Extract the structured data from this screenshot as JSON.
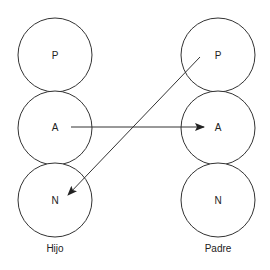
{
  "diagram": {
    "columns": [
      {
        "id": "hijo",
        "label": "Hijo",
        "nodes": [
          {
            "id": "hijo-p",
            "label": "P"
          },
          {
            "id": "hijo-a",
            "label": "A"
          },
          {
            "id": "hijo-n",
            "label": "N"
          }
        ]
      },
      {
        "id": "padre",
        "label": "Padre",
        "nodes": [
          {
            "id": "padre-p",
            "label": "P"
          },
          {
            "id": "padre-a",
            "label": "A"
          },
          {
            "id": "padre-n",
            "label": "N"
          }
        ]
      }
    ],
    "edges": [
      {
        "from": "hijo-a",
        "to": "padre-a"
      },
      {
        "from": "padre-p",
        "to": "hijo-n"
      }
    ],
    "colors": {
      "stroke": "#333333",
      "text": "#222222",
      "background": "#ffffff"
    }
  }
}
